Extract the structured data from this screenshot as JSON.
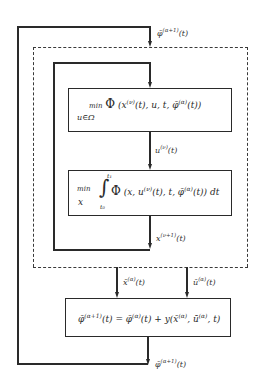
{
  "diagram": {
    "type": "iterative-algorithm-flowchart",
    "labels": {
      "input_top": {
        "base": "φ̄",
        "sup": "(α+1)",
        "arg": "(t)"
      },
      "u_signal": {
        "base": "u",
        "sup": "(ν)",
        "arg": "(t)"
      },
      "x_signal": {
        "base": "x",
        "sup": "(ν+1)",
        "arg": "(t)"
      },
      "x_out": {
        "base": "x̄",
        "sup": "(α)",
        "arg": "(t)"
      },
      "u_out": {
        "base": "ū",
        "sup": "(α)",
        "arg": "(t)"
      },
      "output_bottom": {
        "base": "φ̄",
        "sup": "(α+1)",
        "arg": "(t)"
      }
    },
    "boxes": [
      {
        "id": "minimize-hamiltonian",
        "op": "min",
        "sub": "u∈Ω",
        "func": "Φ",
        "args_pre": "(x",
        "args_sup1": "(ν)",
        "args_mid": "(t), u, t, φ̄",
        "args_sup2": "(α)",
        "args_post": "(t))"
      },
      {
        "id": "minimize-integral",
        "op": "min",
        "sub": "x",
        "int_lower": "t₀",
        "int_upper": "t₁",
        "func": "Φ",
        "args_pre": "(x, u",
        "args_sup1": "(ν)",
        "args_mid": "(t), t, φ̄",
        "args_sup2": "(α)",
        "args_post": "(t)) dt"
      },
      {
        "id": "update-costate",
        "lhs_base": "φ̄",
        "lhs_sup": "(α+1)",
        "lhs_arg": "(t) = φ̄",
        "rhs_sup": "(α)",
        "rhs_mid": "(t) + y(x̄",
        "rhs_sup2": "(α)",
        "rhs_mid2": ", ū",
        "rhs_sup3": "(α)",
        "rhs_post": ", t)"
      }
    ]
  }
}
